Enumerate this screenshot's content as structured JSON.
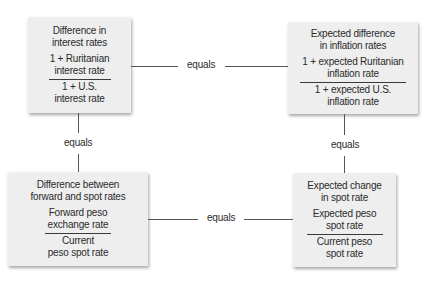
{
  "diagram": {
    "connector_label": "equals",
    "boxes": {
      "interest": {
        "title_line1": "Difference in",
        "title_line2": "interest rates",
        "numerator_line1": "1 + Ruritanian",
        "numerator_line2": "interest rate",
        "denominator_line1": "1 + U.S.",
        "denominator_line2": "interest rate"
      },
      "inflation": {
        "title_line1": "Expected difference",
        "title_line2": "in inflation rates",
        "numerator_line1": "1 + expected Ruritanian",
        "numerator_line2": "inflation rate",
        "denominator_line1": "1 + expected U.S.",
        "denominator_line2": "inflation rate"
      },
      "forward": {
        "title_line1": "Difference between",
        "title_line2": "forward and spot rates",
        "numerator_line1": "Forward peso",
        "numerator_line2": "exchange rate",
        "denominator_line1": "Current",
        "denominator_line2": "peso spot rate"
      },
      "spot_change": {
        "title_line1": "Expected change",
        "title_line2": "in spot rate",
        "numerator_line1": "Expected peso",
        "numerator_line2": "spot rate",
        "denominator_line1": "Current peso",
        "denominator_line2": "spot rate"
      }
    },
    "connections": [
      {
        "from": "interest",
        "to": "inflation",
        "label": "equals"
      },
      {
        "from": "interest",
        "to": "forward",
        "label": "equals"
      },
      {
        "from": "inflation",
        "to": "spot_change",
        "label": "equals"
      },
      {
        "from": "forward",
        "to": "spot_change",
        "label": "equals"
      }
    ]
  }
}
